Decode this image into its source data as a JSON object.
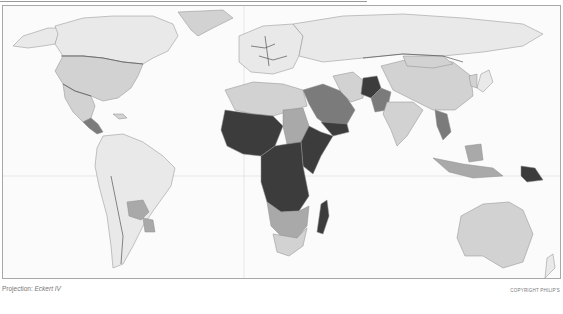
{
  "map": {
    "projection_label": "Projection:",
    "projection_name": "Eckert IV",
    "copyright": "COPYRIGHT PHILIP'S",
    "palette": {
      "ocean": "#fbfbfb",
      "class_0": "#e9e9e9",
      "class_1": "#d2d2d2",
      "class_2": "#a9a9a9",
      "class_3": "#7b7b7b",
      "class_4": "#3c3c3c"
    },
    "regions": [
      {
        "name": "North America",
        "shade": "class_1"
      },
      {
        "name": "Greenland",
        "shade": "class_1"
      },
      {
        "name": "Canada",
        "shade": "class_0"
      },
      {
        "name": "United States",
        "shade": "class_1"
      },
      {
        "name": "Mexico",
        "shade": "class_1"
      },
      {
        "name": "Central America",
        "shade": "class_3"
      },
      {
        "name": "South America",
        "shade": "class_0"
      },
      {
        "name": "Bolivia",
        "shade": "class_2"
      },
      {
        "name": "Paraguay",
        "shade": "class_2"
      },
      {
        "name": "Europe",
        "shade": "class_0"
      },
      {
        "name": "Russia",
        "shade": "class_0"
      },
      {
        "name": "North Africa",
        "shade": "class_1"
      },
      {
        "name": "West Africa",
        "shade": "class_4"
      },
      {
        "name": "Central Africa",
        "shade": "class_4"
      },
      {
        "name": "East Africa",
        "shade": "class_4"
      },
      {
        "name": "Sudan",
        "shade": "class_2"
      },
      {
        "name": "Southern Africa",
        "shade": "class_2"
      },
      {
        "name": "South Africa",
        "shade": "class_1"
      },
      {
        "name": "Madagascar",
        "shade": "class_4"
      },
      {
        "name": "Arabian Peninsula",
        "shade": "class_3"
      },
      {
        "name": "Yemen",
        "shade": "class_4"
      },
      {
        "name": "Afghanistan",
        "shade": "class_4"
      },
      {
        "name": "Pakistan",
        "shade": "class_3"
      },
      {
        "name": "India",
        "shade": "class_1"
      },
      {
        "name": "China",
        "shade": "class_1"
      },
      {
        "name": "Mongolia",
        "shade": "class_1"
      },
      {
        "name": "Southeast Asia",
        "shade": "class_3"
      },
      {
        "name": "Indonesia",
        "shade": "class_2"
      },
      {
        "name": "Papua New Guinea",
        "shade": "class_4"
      },
      {
        "name": "Australia",
        "shade": "class_1"
      },
      {
        "name": "Japan",
        "shade": "class_1"
      }
    ]
  }
}
